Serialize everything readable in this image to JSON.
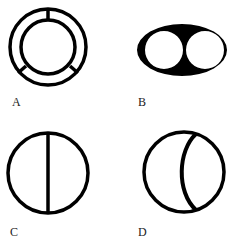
{
  "figures": [
    {
      "label": "A",
      "description": "ring of two concentric circles joined by three radial spokes"
    },
    {
      "label": "B",
      "description": "solid black ellipse with two circular holes side by side"
    },
    {
      "label": "C",
      "description": "circle divided by a vertical diameter line"
    },
    {
      "label": "D",
      "description": "circle with an inner curved chord bulging left on the right side"
    }
  ],
  "colors": {
    "stroke": "#000000",
    "background": "#ffffff"
  }
}
